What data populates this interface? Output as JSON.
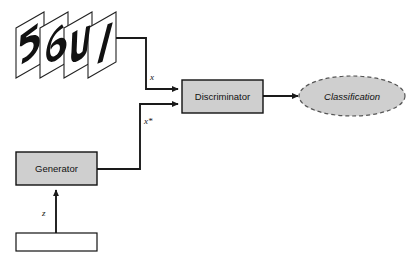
{
  "diagram": {
    "background_color": "#ffffff",
    "node_fill_color": "#cfcfcf",
    "stroke_color": "#111111",
    "nodes": {
      "real_data": {
        "name": "image-stack",
        "label": "",
        "icon": "handwritten-digit-cards",
        "card_count": 4,
        "glyphs": [
          "5",
          "6",
          "4",
          "1"
        ]
      },
      "discriminator": {
        "label": "Discriminator",
        "shape": "rectangle"
      },
      "classification": {
        "label": "Classification",
        "shape": "ellipse",
        "border_style": "dashed",
        "text_style": "italic"
      },
      "generator": {
        "label": "Generator",
        "shape": "rectangle"
      },
      "noise_source": {
        "label": "",
        "shape": "rectangle",
        "icon": "noise-texture"
      }
    },
    "edges": [
      {
        "name": "real-to-discriminator",
        "label": "x",
        "from": "image-stack",
        "to": "discriminator"
      },
      {
        "name": "generator-to-discriminator",
        "label": "x*",
        "from": "generator",
        "to": "discriminator"
      },
      {
        "name": "noise-to-generator",
        "label": "z",
        "from": "noise-source",
        "to": "generator"
      },
      {
        "name": "discriminator-to-classification",
        "label": "",
        "from": "discriminator",
        "to": "classification"
      }
    ]
  }
}
